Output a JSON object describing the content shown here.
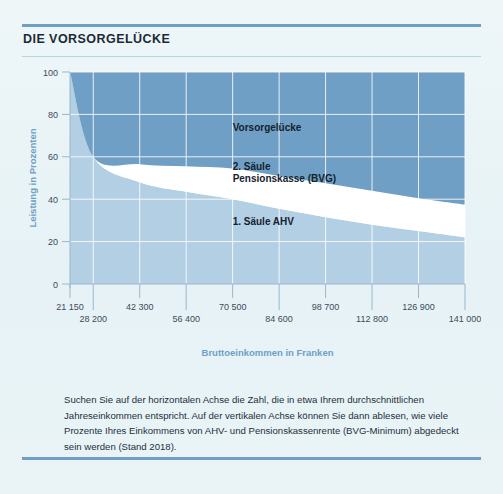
{
  "panel": {
    "title": "DIE VORSORGELÜCKE",
    "caption": "Suchen Sie auf der horizontalen Achse die Zahl, die in etwa Ihrem durchschnittlichen Jahreseinkommen entspricht. Auf der vertikalen Achse können Sie dann ablesen, wie viele Prozente Ihres Einkommens von AHV- und Pensionskassenrente (BVG-Minimum) abgedeckt sein werden (Stand 2018)."
  },
  "colors": {
    "accent": "#6f9fc4",
    "gap_fill": "#6f9fc4",
    "ahv_fill": "#b3cfe4",
    "bvg_fill": "#ffffff",
    "background": "#eaf4f7",
    "grid": "#eaf4f7",
    "title_text": "#1b2a36",
    "tick_text": "#3b4c58"
  },
  "chart_data": {
    "type": "area",
    "title": "DIE VORSORGELÜCKE",
    "xlabel": "Bruttoeinkommen in Franken",
    "ylabel": "Leistung in Prozenten",
    "ylim": [
      0,
      100
    ],
    "yticks": [
      0,
      20,
      40,
      60,
      80,
      100
    ],
    "grid": true,
    "stacked": true,
    "legend_position": "inline-labels",
    "x": [
      21150,
      28200,
      42300,
      56400,
      70500,
      84600,
      98700,
      112800,
      126900,
      141000
    ],
    "xtick_labels_upper": [
      "21 150",
      "42 300",
      "70 500",
      "98 700",
      "126 900"
    ],
    "xtick_labels_lower": [
      "28 200",
      "56 400",
      "84 600",
      "112 800",
      "141 000"
    ],
    "xtick_labels": [
      "21 150",
      "28 200",
      "42 300",
      "56 400",
      "70 500",
      "84 600",
      "98 700",
      "112 800",
      "126 900",
      "141 000"
    ],
    "series": [
      {
        "name": "1. Säule AHV",
        "color": "#b3cfe4",
        "values": [
          100,
          60,
          48,
          43.5,
          40,
          35.5,
          31.5,
          28,
          25,
          22
        ]
      },
      {
        "name": "2. Säule Pensionskasse (BVG)",
        "color": "#ffffff",
        "values": [
          0,
          0,
          8.5,
          12,
          14.5,
          15.5,
          16,
          16,
          15.5,
          15.5
        ]
      },
      {
        "name": "Vorsorgelücke",
        "color": "#6f9fc4",
        "values": [
          0,
          40,
          43.5,
          44.5,
          45.5,
          49,
          52.5,
          56,
          59.5,
          62.5
        ]
      }
    ],
    "annotations": [
      {
        "text": "Vorsorgelücke",
        "x": 70500,
        "y": 72
      },
      {
        "text": "2. Säule",
        "x": 70500,
        "y": 54
      },
      {
        "text": "Pensionskasse (BVG)",
        "x": 70500,
        "y": 48
      },
      {
        "text": "1. Säule AHV",
        "x": 70500,
        "y": 28
      }
    ]
  }
}
